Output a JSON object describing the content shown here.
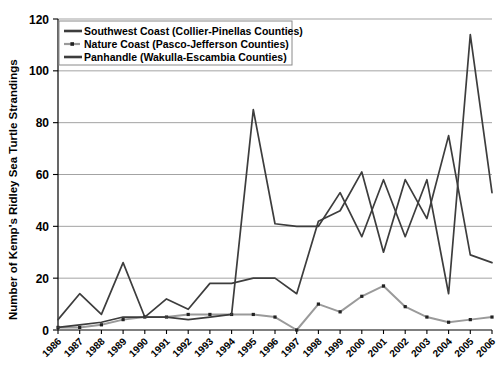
{
  "chart_data": {
    "type": "line",
    "title": "",
    "xlabel": "",
    "ylabel": "Number of Kemp's Ridley Sea Turtle Strandings",
    "ylim": [
      0,
      120
    ],
    "ytick_values": [
      0,
      20,
      40,
      60,
      80,
      100,
      120
    ],
    "grid": true,
    "legend_position": "top-left",
    "categories": [
      "1986",
      "1987",
      "1988",
      "1989",
      "1990",
      "1991",
      "1992",
      "1993",
      "1994",
      "1995",
      "1996",
      "1997",
      "1998",
      "1999",
      "2000",
      "2001",
      "2002",
      "2003",
      "2004",
      "2005",
      "2006"
    ],
    "series": [
      {
        "name": "Southwest Coast (Collier-Pinellas Counties)",
        "color": "#3d3d3d",
        "values": [
          4,
          14,
          6,
          26,
          5,
          12,
          8,
          18,
          18,
          20,
          20,
          14,
          42,
          46,
          61,
          30,
          58,
          43,
          75,
          29,
          26
        ]
      },
      {
        "name": "Nature Coast (Pasco-Jefferson Counties)",
        "color": "#9a9a9a",
        "values": [
          1,
          1,
          2,
          4,
          5,
          5,
          6,
          6,
          6,
          6,
          5,
          0,
          10,
          7,
          13,
          17,
          9,
          5,
          3,
          4,
          5
        ]
      },
      {
        "name": "Panhandle (Wakulla-Escambia Counties)",
        "color": "#3d3d3d",
        "values": [
          1,
          2,
          3,
          5,
          5,
          5,
          4,
          5,
          6,
          85,
          41,
          40,
          40,
          53,
          36,
          58,
          36,
          58,
          14,
          114,
          53
        ]
      }
    ]
  },
  "legend": {
    "items": [
      {
        "label": "Southwest Coast (Collier-Pinellas Counties)",
        "style": "line"
      },
      {
        "label": "Nature Coast (Pasco-Jefferson Counties)",
        "style": "line-marker"
      },
      {
        "label": "Panhandle (Wakulla-Escambia Counties)",
        "style": "line"
      }
    ]
  },
  "axis": {
    "y_ticks": [
      "0",
      "20",
      "40",
      "60",
      "80",
      "100",
      "120"
    ],
    "x_ticks": [
      "1986",
      "1987",
      "1988",
      "1989",
      "1990",
      "1991",
      "1992",
      "1993",
      "1994",
      "1995",
      "1996",
      "1997",
      "1998",
      "1999",
      "2000",
      "2001",
      "2002",
      "2003",
      "2004",
      "2005",
      "2006"
    ],
    "y_title": "Number of Kemp's Ridley Sea Turtle Strandings"
  }
}
